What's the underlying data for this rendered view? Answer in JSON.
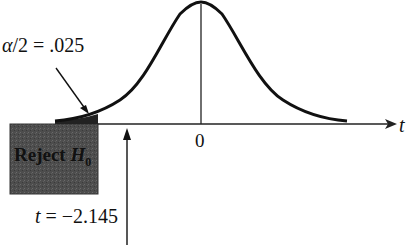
{
  "diagram": {
    "type": "t-distribution one-tailed rejection region",
    "alpha_label": {
      "symbol": "α",
      "text": "/2 = .025"
    },
    "axis": {
      "variable": "t",
      "center_tick": "0"
    },
    "rejection_region": {
      "label_prefix": "Reject ",
      "label_var": "H",
      "label_sub": "0",
      "fill": "#4a4a4a"
    },
    "critical_value": {
      "var": "t",
      "text": " = −2.145"
    },
    "colors": {
      "curve": "#111111",
      "axis": "#222222",
      "shade": "#4a4a4a"
    }
  }
}
